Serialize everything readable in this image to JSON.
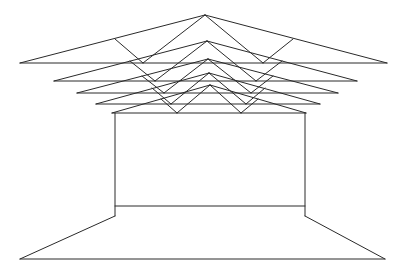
{
  "drawing": {
    "description": "Perspective line drawing of a room with stacked roof trusses",
    "stroke_color": "#2a2a2a",
    "background": "#ffffff",
    "trusses": [
      {
        "left": [
          20,
          63
        ],
        "right": [
          387,
          63
        ],
        "apex": [
          205,
          15
        ],
        "webLeftTop": [
          115,
          39
        ],
        "webLeftBottom": [
          143,
          63
        ],
        "webRightTop": [
          293,
          39
        ],
        "webRightBottom": [
          263,
          63
        ]
      },
      {
        "left": [
          54,
          81
        ],
        "right": [
          357,
          81
        ],
        "apex": [
          207,
          41
        ],
        "webLeftTop": [
          130,
          61
        ],
        "webLeftBottom": [
          155,
          81
        ],
        "webRightTop": [
          282,
          61
        ],
        "webRightBottom": [
          256,
          81
        ]
      },
      {
        "left": [
          77,
          93
        ],
        "right": [
          338,
          93
        ],
        "apex": [
          208,
          59
        ],
        "webLeftTop": [
          142,
          76
        ],
        "webLeftBottom": [
          164,
          93
        ],
        "webRightTop": [
          273,
          76
        ],
        "webRightBottom": [
          251,
          93
        ]
      },
      {
        "left": [
          96,
          104
        ],
        "right": [
          320,
          104
        ],
        "apex": [
          209,
          73
        ],
        "webLeftTop": [
          152,
          88
        ],
        "webLeftBottom": [
          171,
          104
        ],
        "webRightTop": [
          265,
          88
        ],
        "webRightBottom": [
          246,
          104
        ]
      },
      {
        "left": [
          112,
          113
        ],
        "right": [
          306,
          113
        ],
        "apex": [
          210,
          85
        ],
        "webLeftTop": [
          161,
          99
        ],
        "webLeftBottom": [
          177,
          113
        ],
        "webRightTop": [
          258,
          99
        ],
        "webRightBottom": [
          241,
          113
        ]
      }
    ],
    "room": {
      "wallLeftTop": [
        115,
        113
      ],
      "wallRightTop": [
        305,
        113
      ],
      "backWallBottomY": 206,
      "wallBaseY": 216,
      "floorLeft": [
        20,
        259
      ],
      "floorRight": [
        385,
        259
      ]
    }
  }
}
